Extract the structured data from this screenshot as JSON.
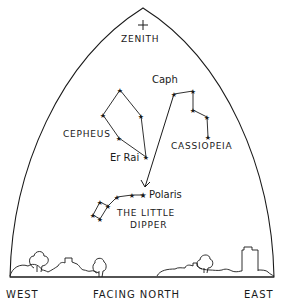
{
  "diagram": {
    "type": "sky-chart",
    "ink_color": "#1a1a1a",
    "background": "#ffffff",
    "labels": {
      "zenith": "ZENITH",
      "cepheus": "CEPHEUS",
      "cassiopeia": "CASSIOPEIA",
      "caph": "Caph",
      "er_rai": "Er Rai",
      "polaris": "Polaris",
      "little_dipper_line1": "THE LITTLE",
      "little_dipper_line2": "DIPPER",
      "west": "WEST",
      "east": "EAST",
      "facing": "FACING NORTH"
    },
    "zenith_marker": {
      "x": 143,
      "y": 25
    },
    "constellations": [
      {
        "name": "Cepheus",
        "stars": [
          [
            120,
            90
          ],
          [
            141,
            116
          ],
          [
            146,
            157
          ],
          [
            119,
            138
          ],
          [
            103,
            115
          ],
          [
            120,
            90
          ]
        ]
      },
      {
        "name": "Cassiopeia",
        "stars": [
          [
            174,
            94
          ],
          [
            193,
            91
          ],
          [
            193,
            110
          ],
          [
            207,
            117
          ],
          [
            208,
            137
          ]
        ]
      },
      {
        "name": "Little Dipper",
        "stars": [
          [
            143,
            195
          ],
          [
            132,
            195
          ],
          [
            117,
            197
          ],
          [
            108,
            206
          ],
          [
            100,
            202
          ],
          [
            93,
            215
          ],
          [
            100,
            219
          ],
          [
            108,
            207
          ]
        ]
      }
    ],
    "pointer_arrow": {
      "from": [
        174,
        94
      ],
      "to": [
        145,
        187
      ],
      "label": "Caph to Polaris"
    }
  }
}
